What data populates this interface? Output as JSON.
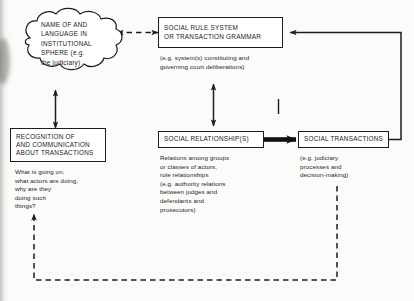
{
  "figure": {
    "ink_color": "#1c1c1c",
    "background": "#fbfbfa"
  },
  "nodes": {
    "cloud": {
      "shape": "cloud",
      "lines": [
        "NAME OF AND",
        "LANGUAGE IN",
        "INSTITUTIONAL",
        "SPHERE (e.g.",
        "the judiciary)"
      ]
    },
    "rule_system": {
      "shape": "box",
      "lines": [
        "SOCIAL RULE SYSTEM",
        "OR TRANSACTION GRAMMAR"
      ],
      "caption": [
        "(e.g. system(s) constituting and",
        "governing court deliberations)"
      ]
    },
    "recognition": {
      "shape": "box",
      "lines": [
        "RECOGNITION OF",
        "AND COMMUNICATION",
        "ABOUT TRANSACTIONS"
      ],
      "caption": [
        "What is going on,",
        "what actors are doing,",
        "why are they",
        "doing such",
        "things?"
      ]
    },
    "social_relationships": {
      "shape": "box",
      "lines": [
        "SOCIAL RELATIONSHIP(S)"
      ],
      "caption": [
        "Relations among groups",
        "or classes of actors,",
        "role relationships",
        "(e.g. authority relations",
        "between judges and",
        "defendants and",
        "prosecutors)"
      ]
    },
    "social_transactions": {
      "shape": "box",
      "lines": [
        "SOCIAL TRANSACTIONS"
      ],
      "caption": [
        "(e.g. judiciary",
        "processes and",
        "decision-making)"
      ]
    }
  },
  "connectors": [
    {
      "name": "cloud-to-rule-system",
      "style": "dashed",
      "heads": "both",
      "from": "cloud",
      "to": "rule_system"
    },
    {
      "name": "cloud-to-recognition",
      "style": "solid",
      "heads": "both",
      "from": "cloud",
      "to": "recognition"
    },
    {
      "name": "rule-system-to-social-relationships",
      "style": "solid",
      "heads": "both",
      "from": "rule_system",
      "to": "social_relationships"
    },
    {
      "name": "social-relationships-to-social-transactions",
      "style": "solid-thick",
      "heads": "single",
      "from": "social_relationships",
      "to": "social_transactions"
    },
    {
      "name": "social-transactions-feedback-to-rule-system",
      "style": "solid",
      "heads": "single",
      "from": "social_transactions",
      "to": "rule_system"
    },
    {
      "name": "feedback-loop-to-recognition",
      "style": "dashed",
      "heads": "single",
      "from": "social_transactions",
      "to": "recognition"
    },
    {
      "name": "tick-mark",
      "style": "solid",
      "heads": "none",
      "from": "rule_system",
      "to": "social_transactions"
    }
  ]
}
